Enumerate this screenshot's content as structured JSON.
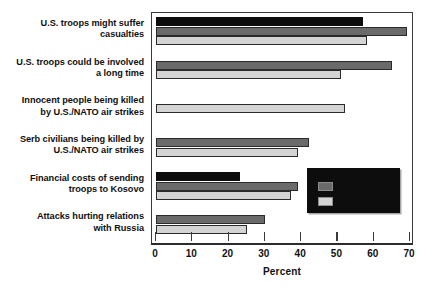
{
  "chart_data": {
    "type": "bar",
    "orientation": "horizontal",
    "title": "",
    "xlabel": "Percent",
    "ylabel": "",
    "xlim": [
      0,
      70
    ],
    "xticks": [
      0,
      10,
      20,
      30,
      40,
      50,
      60,
      70
    ],
    "xtick_labels": [
      "0",
      "10",
      "20",
      "30",
      "40",
      "50",
      "60",
      "70"
    ],
    "grid": false,
    "legend_position": "inside-right-lower",
    "categories": [
      "U.S. troops might suffer casualties",
      "U.S. troops could be involved a long time",
      "Innocent people being killed by U.S./NATO air strikes",
      "Serb civilians being killed by U.S./NATO air strikes",
      "Financial costs of sending troops to Kosovo",
      "Attacks hurting relations with Russia"
    ],
    "category_lines": [
      [
        "U.S. troops might suffer",
        "casualties"
      ],
      [
        "U.S. troops could be involved",
        "a long time"
      ],
      [
        "Innocent people being killed",
        "by U.S./NATO air strikes"
      ],
      [
        "Serb civilians being killed by",
        "U.S./NATO air strikes"
      ],
      [
        "Financial costs of sending",
        "troops to Kosovo"
      ],
      [
        "Attacks hurting relations",
        "with Russia"
      ]
    ],
    "series": [
      {
        "name": "series-1",
        "color": "#0d0d0d",
        "values": [
          56,
          null,
          null,
          null,
          22,
          null
        ]
      },
      {
        "name": "series-2",
        "color": "#6a6a6a",
        "values": [
          68,
          64,
          null,
          41,
          38,
          29
        ]
      },
      {
        "name": "series-3",
        "color": "#d4d4d4",
        "values": [
          57,
          50,
          51,
          38,
          36,
          24
        ]
      }
    ]
  },
  "legend": {
    "rows": [
      {
        "swatch_color": "#6a6a6a",
        "label": ""
      },
      {
        "swatch_color": "#d4d4d4",
        "label": ""
      }
    ]
  },
  "source": {
    "text": ""
  }
}
